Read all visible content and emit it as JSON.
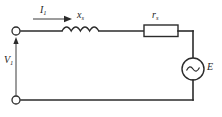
{
  "figure": {
    "name": "single-phase-equivalent-circuit",
    "type": "electrical-schematic",
    "background_color": "#ffffff",
    "line_color": "#2b2b2b",
    "width": 222,
    "height": 117
  },
  "labels": {
    "current": {
      "symbol": "I",
      "subscript": "1",
      "text": "I1"
    },
    "reactance": {
      "symbol": "x",
      "subscript": "s",
      "text": "xs"
    },
    "resistance": {
      "symbol": "r",
      "subscript": "s",
      "text": "rs"
    },
    "voltage_terminal": {
      "symbol": "V",
      "subscript": "1",
      "text": "V1"
    },
    "source_emf": {
      "symbol": "E",
      "subscript": "",
      "text": "E"
    }
  },
  "components": [
    {
      "name": "terminal-top",
      "kind": "open-terminal",
      "x": 16,
      "y": 31
    },
    {
      "name": "terminal-bottom",
      "kind": "open-terminal",
      "x": 16,
      "y": 100
    },
    {
      "name": "inductor",
      "kind": "coil",
      "label": "xs",
      "turns": 4
    },
    {
      "name": "resistor",
      "kind": "rectangle",
      "label": "rs"
    },
    {
      "name": "ac-source",
      "kind": "circle-sine",
      "label": "E"
    },
    {
      "name": "current-arrow",
      "kind": "arrow-right",
      "label": "I1"
    },
    {
      "name": "voltage-arrow",
      "kind": "arrow-up",
      "label": "V1"
    }
  ]
}
